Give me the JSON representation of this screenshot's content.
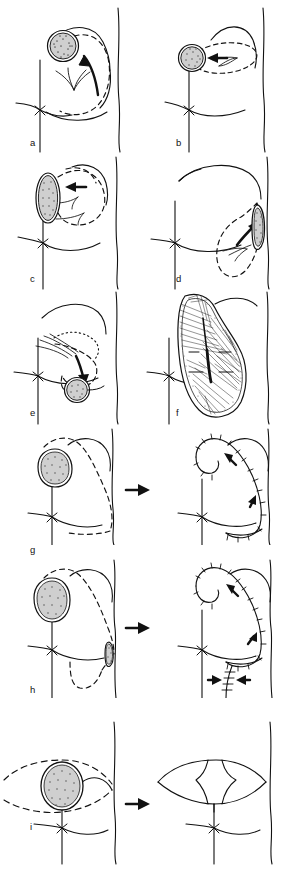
{
  "figure": {
    "type": "medical-illustration",
    "width": 290,
    "height": 870,
    "background_color": "#ffffff",
    "ink_color": "#111111",
    "lesion_fill_color": "#c8c8c8",
    "lesion_stipple_color": "#6b6b6b",
    "panel_count": 9
  },
  "labels": {
    "a": "a",
    "b": "b",
    "c": "c",
    "d": "d",
    "e": "e",
    "f": "f",
    "g": "g",
    "h": "h",
    "i": "i"
  },
  "panels": [
    {
      "id": "a",
      "label": "a",
      "row": 1,
      "column": "left",
      "lesion": {
        "shape": "circle",
        "position": "upper-inner-quadrant",
        "cx": 63,
        "cy": 46,
        "r": 15
      },
      "markings": [
        "dashed-excision-outline",
        "curved-rotation-arrow",
        "glandular-pillar-lines"
      ],
      "arrow_count": 1,
      "arrow_style": "curved-solid"
    },
    {
      "id": "b",
      "label": "b",
      "row": 1,
      "column": "right",
      "lesion": {
        "shape": "circle",
        "position": "medial-upper",
        "cx": 192,
        "cy": 58,
        "r": 13
      },
      "markings": [
        "dashed-elliptical-outline",
        "straight-medial-arrow",
        "glandular-pillar-lines"
      ],
      "arrow_count": 1,
      "arrow_style": "straight-solid"
    },
    {
      "id": "c",
      "label": "c",
      "row": 2,
      "column": "left",
      "lesion": {
        "shape": "vertical-ellipse",
        "position": "medial",
        "cx": 48,
        "cy": 198,
        "rx": 11,
        "ry": 23
      },
      "markings": [
        "dashed-excision-outline",
        "straight-medial-arrow",
        "glandular-pillar-lines"
      ],
      "arrow_count": 1,
      "arrow_style": "straight-solid"
    },
    {
      "id": "d",
      "label": "d",
      "row": 2,
      "column": "right",
      "lesion": {
        "shape": "vertical-ellipse",
        "position": "lateral",
        "cx": 264,
        "cy": 225,
        "rx": 6,
        "ry": 20
      },
      "markings": [
        "dashed-excision-outline",
        "curved-lateral-arrow",
        "glandular-pillar-lines"
      ],
      "arrow_count": 1,
      "arrow_style": "curved-solid"
    },
    {
      "id": "e",
      "label": "e",
      "row": 3,
      "column": "left",
      "lesion": {
        "shape": "circle",
        "position": "lower-inner-quadrant",
        "cx": 77,
        "cy": 390,
        "r": 12
      },
      "markings": [
        "dotted-excision-outline",
        "dashed-excision-outline",
        "curved-inferior-arrow",
        "glandular-pillar-lines"
      ],
      "arrow_count": 1,
      "arrow_style": "curved-solid"
    },
    {
      "id": "f",
      "label": "f",
      "row": 3,
      "column": "right",
      "lesion": null,
      "markings": [
        "dissected-gland-hatching",
        "fibrous-septa-lines",
        "stippled-margin",
        "elevated-flap"
      ],
      "arrow_count": 0,
      "arrow_style": "none"
    },
    {
      "id": "g",
      "label": "g",
      "row": 4,
      "column": "pair",
      "lesion": {
        "shape": "round",
        "position": "upper-inner-quadrant",
        "cx": 54,
        "cy": 465,
        "r": 17
      },
      "markings": [
        "dashed-excision-outline",
        "transition-arrow",
        "suture-line-ticks",
        "mobilisation-arrows"
      ],
      "arrow_count": 3,
      "arrow_style": "mixed",
      "before_after": true
    },
    {
      "id": "h",
      "label": "h",
      "row": 5,
      "column": "pair",
      "lesion": {
        "shape": "round",
        "position": "upper-inner-quadrant",
        "cx": 52,
        "cy": 577,
        "r": 18
      },
      "secondary_lesion": {
        "shape": "vertical-ellipse",
        "position": "lateral-inframammary",
        "cx": 123,
        "cy": 617
      },
      "markings": [
        "dashed-excision-outline",
        "inframammary-dashed-extension",
        "transition-arrow",
        "suture-line-ticks",
        "mobilisation-arrows",
        "opposing-arrows"
      ],
      "arrow_count": 5,
      "arrow_style": "mixed",
      "before_after": true
    },
    {
      "id": "i",
      "label": "i",
      "row": 6,
      "column": "pair",
      "lesion": {
        "shape": "oval",
        "position": "central-periareolar",
        "cx": 62,
        "cy": 782,
        "rx": 19,
        "ry": 22
      },
      "markings": [
        "dashed-round-block-outline",
        "transition-arrow",
        "closed-flap-lines"
      ],
      "arrow_count": 1,
      "arrow_style": "transition",
      "before_after": true
    }
  ],
  "transition_arrows": [
    {
      "for_panel": "g",
      "x": 126,
      "y": 490,
      "direction": "right"
    },
    {
      "for_panel": "h",
      "x": 126,
      "y": 628,
      "direction": "right"
    },
    {
      "for_panel": "i",
      "x": 126,
      "y": 803,
      "direction": "right"
    }
  ],
  "legend": {
    "dashed_line_meaning": "planned incision / de-epithelialisation outline",
    "solid_arrow_meaning": "direction of glandular flap advancement",
    "stippled_area_meaning": "tumour / specimen",
    "tick_line_meaning": "suture line"
  }
}
